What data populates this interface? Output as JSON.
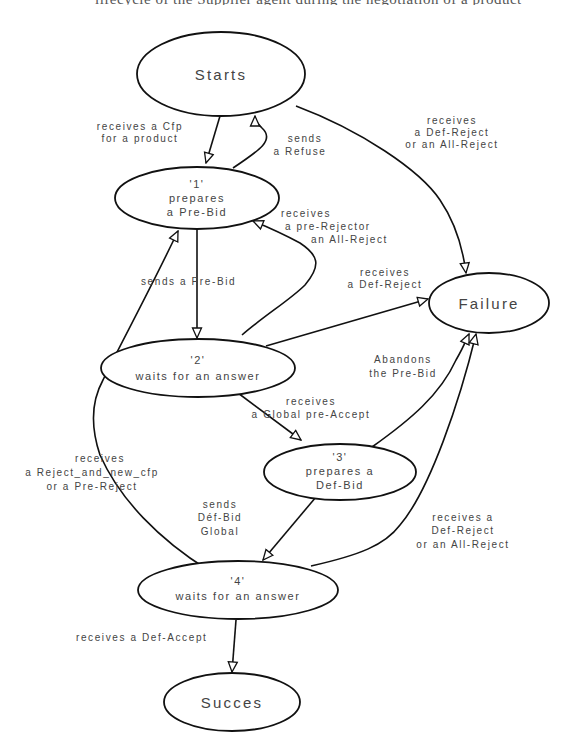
{
  "diagram": {
    "type": "state-transition",
    "nodes": [
      {
        "id": "starts",
        "label": "Starts",
        "lines": [
          "Starts"
        ]
      },
      {
        "id": "n1",
        "label": "'1' prepares a Pre-Bid",
        "lines": [
          "'1'",
          "prepares",
          "a Pre-Bid"
        ]
      },
      {
        "id": "n2",
        "label": "'2' waits for an answer",
        "lines": [
          "'2'",
          "waits for an answer"
        ]
      },
      {
        "id": "failure",
        "label": "Failure",
        "lines": [
          "Failure"
        ]
      },
      {
        "id": "n3",
        "label": "'3' prepares a Def-Bid",
        "lines": [
          "'3'",
          "prepares a",
          "Def-Bid"
        ]
      },
      {
        "id": "n4",
        "label": "'4' waits for an answer",
        "lines": [
          "'4'",
          "waits for an answer"
        ]
      },
      {
        "id": "succes",
        "label": "Succes",
        "lines": [
          "Succes"
        ]
      }
    ],
    "edges": [
      {
        "from": "starts",
        "to": "n1",
        "lines": [
          "receives a Cfp",
          "for a product"
        ]
      },
      {
        "from": "n1",
        "to": "starts",
        "lines": [
          "sends",
          "a Refuse"
        ]
      },
      {
        "from": "starts",
        "to": "failure",
        "lines": [
          "receives",
          "a Def-Reject",
          "or an All-Reject"
        ]
      },
      {
        "from": "n2",
        "to": "n1",
        "lines": [
          "receives",
          "a pre-Rejector",
          "an All-Reject"
        ]
      },
      {
        "from": "n1",
        "to": "n2",
        "lines": [
          "sends a Pre-Bid"
        ]
      },
      {
        "from": "n2",
        "to": "failure",
        "lines": [
          "receives",
          "a Def-Reject"
        ]
      },
      {
        "from": "n3",
        "to": "failure",
        "lines": [
          "Abandons",
          "the Pre-Bid"
        ]
      },
      {
        "from": "n2",
        "to": "n3",
        "lines": [
          "receives",
          "a Global pre-Accept"
        ]
      },
      {
        "from": "n4",
        "to": "n1",
        "lines": [
          "receives",
          "a Reject_and_new_cfp",
          "or a Pre-Reject"
        ]
      },
      {
        "from": "n3",
        "to": "n4",
        "lines": [
          "sends",
          "Déf-Bid",
          "Global"
        ]
      },
      {
        "from": "n4",
        "to": "failure",
        "lines": [
          "receives a",
          "Def-Reject",
          "or an All-Reject"
        ]
      },
      {
        "from": "n4",
        "to": "succes",
        "lines": [
          "receives a Def-Accept"
        ]
      }
    ]
  },
  "page": {
    "top_cut_text": "lifecycle of the Supplier agent during the negotiation of a product"
  }
}
